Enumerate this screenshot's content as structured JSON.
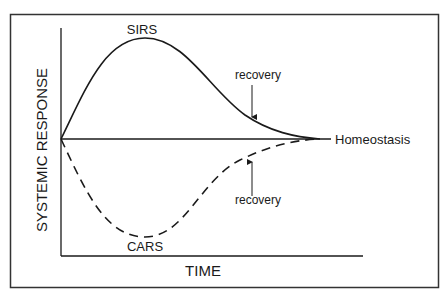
{
  "diagram": {
    "y_axis_label": "SYSTEMIC RESPONSE",
    "x_axis_label": "TIME",
    "baseline_label": "Homeostasis",
    "curves": [
      {
        "name": "SIRS",
        "label": "SIRS",
        "style": "solid",
        "direction": "above baseline"
      },
      {
        "name": "CARS",
        "label": "CARS",
        "style": "dashed",
        "direction": "below baseline"
      }
    ],
    "annotations": [
      {
        "text": "recovery",
        "points_to": "SIRS"
      },
      {
        "text": "recovery",
        "points_to": "CARS"
      }
    ],
    "colors": {
      "line": "#1a1a1a",
      "frame": "#333333",
      "background": "#ffffff"
    }
  }
}
